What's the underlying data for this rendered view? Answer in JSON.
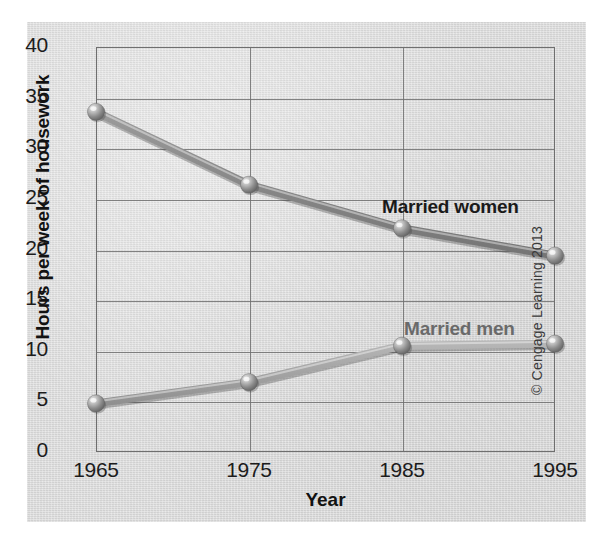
{
  "chart_data": {
    "type": "line",
    "title": "",
    "xlabel": "Year",
    "ylabel": "Hours per week of housework",
    "categories": [
      "1965",
      "1975",
      "1985",
      "1995"
    ],
    "x": [
      1965,
      1975,
      1985,
      1995
    ],
    "xlim": [
      1965,
      1995
    ],
    "ylim": [
      0,
      40
    ],
    "y_ticks": [
      "0",
      "5",
      "10",
      "15",
      "20",
      "25",
      "30",
      "35",
      "40"
    ],
    "y_tick_values": [
      0,
      5,
      10,
      15,
      20,
      25,
      30,
      35,
      40
    ],
    "grid": "horizontal-and-vertical",
    "legend_position": "inline-annotations",
    "series": [
      {
        "name": "Married women",
        "values": [
          33.6,
          26.4,
          22.1,
          19.4
        ],
        "color": "#8d8d8d",
        "label_color": "#1a1a1a"
      },
      {
        "name": "Married men",
        "values": [
          4.8,
          6.9,
          10.5,
          10.7
        ],
        "color": "#a8a8a8",
        "label_color": "#6a6a6a"
      }
    ],
    "annotations": [
      {
        "text": "Married women",
        "series": "Married women"
      },
      {
        "text": "Married men",
        "series": "Married men"
      }
    ],
    "marker_style": "3d-sphere",
    "background_color": "#d9d9d9",
    "axis_color": "#6f6f6f"
  },
  "figure": {
    "copyright": "© Cengage Learning 2013"
  }
}
